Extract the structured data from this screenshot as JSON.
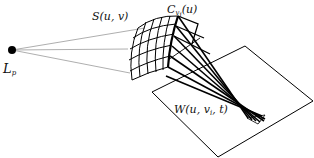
{
  "diagram": {
    "type": "geometric-illustration",
    "labels": {
      "light_source": {
        "main": "L",
        "sub": "p"
      },
      "surface": {
        "text": "S(u, v)"
      },
      "curve": {
        "main": "C",
        "sub": "v",
        "subsub": "i",
        "arg": "(u)"
      },
      "wavefront": {
        "prefix": "W(u, v",
        "sub": "i",
        "suffix": ", t)"
      }
    },
    "colors": {
      "stroke": "#000000",
      "thin_line": "#777777",
      "background": "#ffffff"
    },
    "points": {
      "light_source": [
        12,
        50
      ],
      "convergence": [
        232,
        110
      ]
    },
    "plane_corners": [
      [
        245,
        46
      ],
      [
        313,
        101
      ],
      [
        218,
        157
      ],
      [
        152,
        92
      ]
    ]
  }
}
